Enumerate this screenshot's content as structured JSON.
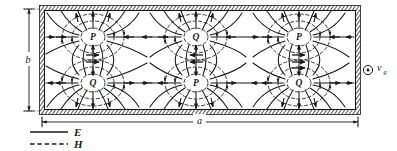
{
  "figure": {
    "cell_labels": [
      {
        "id": "p-top-left",
        "text": "P",
        "x": 93,
        "y": 37
      },
      {
        "id": "q-bottom-left",
        "text": "Q",
        "x": 93,
        "y": 83
      },
      {
        "id": "q-top-middle",
        "text": "Q",
        "x": 196,
        "y": 37
      },
      {
        "id": "p-bottom-middle",
        "text": "P",
        "x": 196,
        "y": 83
      },
      {
        "id": "p-top-right",
        "text": "P",
        "x": 299,
        "y": 37
      },
      {
        "id": "q-bottom-right",
        "text": "Q",
        "x": 299,
        "y": 83
      }
    ],
    "dimension_width_label": "a",
    "dimension_height_label": "b",
    "direction_symbol": "circle-dot",
    "direction_label": "v",
    "direction_sublabel": "g"
  },
  "legend": {
    "items": [
      {
        "key": "E",
        "label": "E",
        "style": "solid"
      },
      {
        "key": "H",
        "label": "H",
        "style": "dashed"
      }
    ]
  },
  "colors": {
    "ink": "#1a1a1a",
    "wall": "#3a3a3a",
    "paper": "#ffffff"
  }
}
